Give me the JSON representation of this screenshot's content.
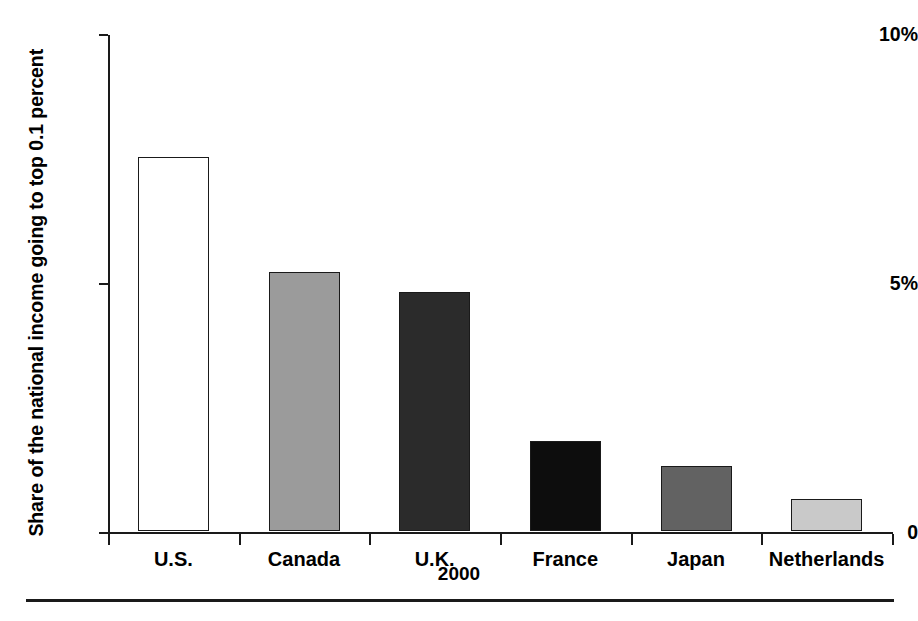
{
  "chart_data": {
    "type": "bar",
    "title": "",
    "subtitle": "",
    "xlabel": "2000",
    "ylabel": "Share of the national income going to top 0.1 percent",
    "categories": [
      "U.S.",
      "Canada",
      "U.K.",
      "France",
      "Japan",
      "Netherlands"
    ],
    "values": [
      7.5,
      5.2,
      4.8,
      1.8,
      1.3,
      0.65
    ],
    "value_unit": "percent",
    "ylim": [
      0,
      10
    ],
    "ytick_values": [
      0,
      5,
      10
    ],
    "ytick_labels": [
      "0",
      "5%",
      "10%"
    ],
    "grid": false,
    "legend": null,
    "legend_position": "none",
    "bar_colors": [
      "#ffffff",
      "#9b9b9b",
      "#2b2b2b",
      "#0d0d0d",
      "#626262",
      "#c9c9c9"
    ],
    "bar_edge_color": "#1a1a1a",
    "axis_color": "#1a1a1a",
    "background_color": "#ffffff",
    "bars": [
      {
        "category": "U.S.",
        "value": 7.5,
        "fill": "#ffffff"
      },
      {
        "category": "Canada",
        "value": 5.2,
        "fill": "#9b9b9b"
      },
      {
        "category": "U.K.",
        "value": 4.8,
        "fill": "#2b2b2b"
      },
      {
        "category": "France",
        "value": 1.8,
        "fill": "#0d0d0d"
      },
      {
        "category": "Japan",
        "value": 1.3,
        "fill": "#626262"
      },
      {
        "category": "Netherlands",
        "value": 0.65,
        "fill": "#c9c9c9"
      }
    ]
  }
}
